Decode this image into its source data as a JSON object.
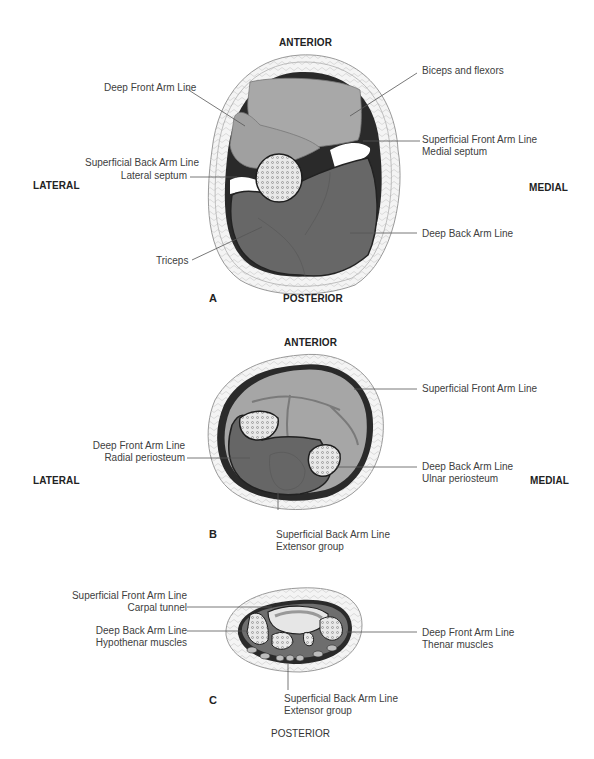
{
  "figure": {
    "colors": {
      "light_muscle": "#a9a9a9",
      "dark_muscle": "#6a6a6a",
      "fascia_line": "#1e1e1e",
      "bone": "#e8e8e8",
      "skin_fat": "#f2f2f2",
      "leader_line": "#555555"
    },
    "panel_a": {
      "letter": "A",
      "anterior": "ANTERIOR",
      "posterior": "POSTERIOR",
      "lateral": "LATERAL",
      "medial": "MEDIAL",
      "labels": {
        "deep_front_arm_line": "Deep Front Arm Line",
        "biceps": "Biceps and flexors",
        "sfal_line1": "Superficial Front Arm Line",
        "sfal_line2": "Medial septum",
        "sbal_line1": "Superficial Back Arm Line",
        "sbal_line2": "Lateral septum",
        "triceps": "Triceps",
        "deep_back_arm_line": "Deep Back Arm Line"
      }
    },
    "panel_b": {
      "letter": "B",
      "anterior": "ANTERIOR",
      "lateral": "LATERAL",
      "medial": "MEDIAL",
      "labels": {
        "sfal": "Superficial Front Arm Line",
        "dfal_line1": "Deep Front Arm Line",
        "dfal_line2": "Radial periosteum",
        "dbal_line1": "Deep Back Arm Line",
        "dbal_line2": "Ulnar periosteum",
        "sbal_line1": "Superficial Back Arm Line",
        "sbal_line2": "Extensor group"
      }
    },
    "panel_c": {
      "letter": "C",
      "posterior": "POSTERIOR",
      "labels": {
        "sfal_line1": "Superficial Front Arm Line",
        "sfal_line2": "Carpal tunnel",
        "dbal_line1": "Deep Back Arm Line",
        "dbal_line2": "Hypothenar muscles",
        "dfal_line1": "Deep Front Arm Line",
        "dfal_line2": "Thenar muscles",
        "sbal_line1": "Superficial Back Arm Line",
        "sbal_line2": "Extensor group"
      }
    }
  }
}
